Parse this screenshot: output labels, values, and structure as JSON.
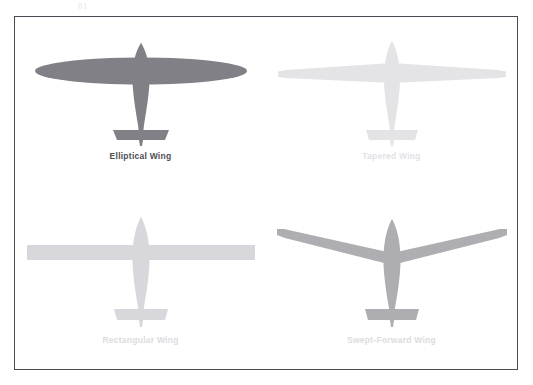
{
  "figure": {
    "scan_artifact_text": "81",
    "border_color": "#4a4a52",
    "background_color": "#ffffff"
  },
  "panels": [
    {
      "id": "elliptical",
      "label": "Elliptical Wing",
      "icon": "airplane-top-view-icon",
      "silhouette_color": "#808086",
      "label_color": "#4d4d52",
      "emphasis": "strong",
      "wing_shape": "elliptical",
      "span_px": 232,
      "row": 1,
      "column": 1
    },
    {
      "id": "tapered",
      "label": "Tapered Wing",
      "icon": "airplane-top-view-icon",
      "silhouette_color": "#e4e4e6",
      "label_color": "#e2e2e6",
      "emphasis": "faint",
      "wing_shape": "tapered",
      "span_px": 232,
      "row": 1,
      "column": 2
    },
    {
      "id": "rectangular",
      "label": "Rectangular Wing",
      "icon": "airplane-top-view-icon",
      "silhouette_color": "#d8d8dc",
      "label_color": "#dcdce0",
      "emphasis": "faint",
      "wing_shape": "rectangular",
      "span_px": 232,
      "row": 2,
      "column": 1
    },
    {
      "id": "swept-forward",
      "label": "Swept-Forward Wing",
      "icon": "airplane-top-view-icon",
      "silhouette_color": "#adadb2",
      "label_color": "#dcdce0",
      "emphasis": "faint",
      "wing_shape": "swept-forward",
      "span_px": 232,
      "row": 2,
      "column": 2
    }
  ]
}
